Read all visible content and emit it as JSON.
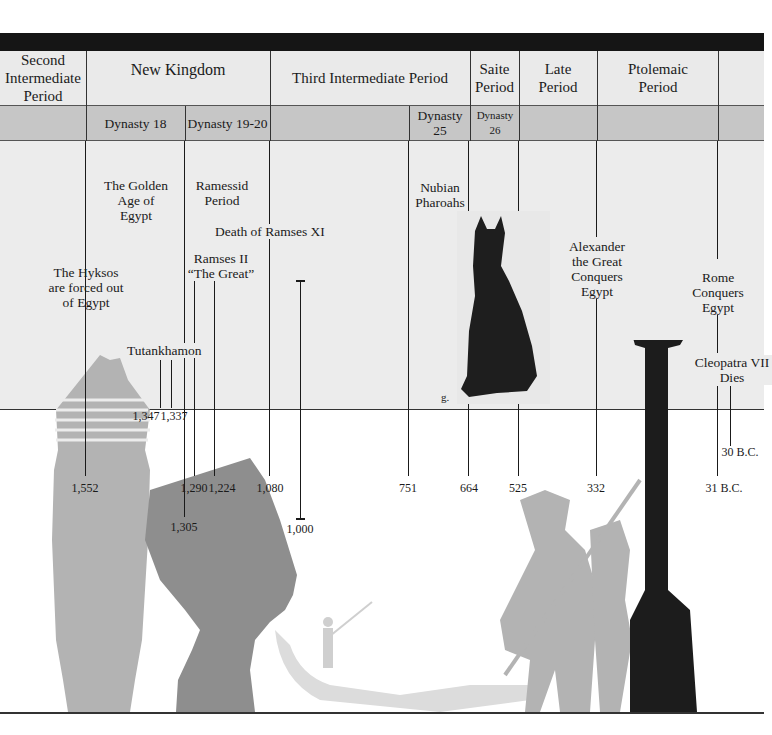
{
  "periods": [
    {
      "label": "Second Intermediate Period",
      "x": 0,
      "w": 86
    },
    {
      "label": "New Kingdom",
      "x": 86,
      "w": 184
    },
    {
      "label": "Third Intermediate Period",
      "x": 270,
      "w": 200
    },
    {
      "label": "Saite Period",
      "x": 470,
      "w": 49
    },
    {
      "label": "Late Period",
      "x": 519,
      "w": 78
    },
    {
      "label": "Ptolemaic Period",
      "x": 597,
      "w": 121
    }
  ],
  "dynasties": [
    {
      "label": "Dynasty 18",
      "x": 86,
      "w": 99
    },
    {
      "label": "Dynasty 19-20",
      "x": 185,
      "w": 85
    },
    {
      "label": "Dynasty 25",
      "x": 409,
      "w": 61
    },
    {
      "label": "Dynasty 26",
      "x": 470,
      "w": 49
    }
  ],
  "events": {
    "hyksos": "The Hyksos are forced out of Egypt",
    "golden_age": "The Golden Age of Egypt",
    "ramessid": "Ramessid Period",
    "death_ramses": "Death of Ramses XI",
    "ramses_ii": "Ramses II “The Great”",
    "tutankhamon": "Tutankhamon",
    "nubian": "Nubian Pharoahs",
    "alexander": "Alexander the Great Conquers Egypt",
    "rome": "Rome Conquers Egypt",
    "cleopatra": "Cleopatra VII Dies",
    "photo_caption": "g."
  },
  "years": {
    "y1552": "1,552",
    "y1347": "1,347",
    "y1337": "1,337",
    "y1305": "1,305",
    "y1290": "1,290",
    "y1224": "1,224",
    "y1080": "1,080",
    "y1000": "1,000",
    "y751": "751",
    "y664": "664",
    "y525": "525",
    "y332": "332",
    "y30bc": "30 B.C.",
    "y31bc": "31 B.C."
  },
  "colors": {
    "topbar": "#151515",
    "period_row": "#eaeaea",
    "dynasty_row": "#c6c6c6",
    "panel": "#ececec",
    "silhouette_light": "#b3b3b3",
    "silhouette_mid": "#8e8e8e",
    "column": "#1c1c1c"
  }
}
